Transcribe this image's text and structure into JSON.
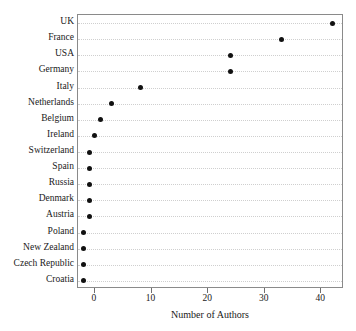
{
  "chart_data": {
    "type": "scatter",
    "title": "",
    "xlabel": "Number of Authors",
    "ylabel": "",
    "xlim": [
      -3,
      44
    ],
    "xticks": [
      0,
      10,
      20,
      30,
      40
    ],
    "xticklabels": [
      "0",
      "10",
      "20",
      "30",
      "40"
    ],
    "grid": true,
    "grid_style": "dotted horizontal",
    "legend": "none",
    "orientation": "horizontal",
    "marker": "filled-circle",
    "marker_color": "#111111",
    "categories": [
      "UK",
      "France",
      "USA",
      "Germany",
      "Italy",
      "Netherlands",
      "Belgium",
      "Ireland",
      "Switzerland",
      "Spain",
      "Russia",
      "Denmark",
      "Austria",
      "Poland",
      "New Zealand",
      "Czech Republic",
      "Croatia"
    ],
    "values": [
      42,
      33,
      24,
      24,
      8,
      3,
      1,
      0,
      -1,
      -1,
      -1,
      -1,
      -1,
      -2,
      -2,
      -2,
      -2
    ]
  },
  "axis": {
    "x_title": "Number of Authors"
  }
}
